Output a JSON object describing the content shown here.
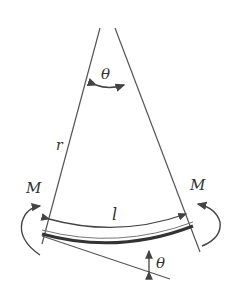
{
  "diagram": {
    "labels": {
      "apex_angle": "θ",
      "radius": "r",
      "moment_left": "M",
      "moment_right": "M",
      "arc_length": "l",
      "tangent_angle": "θ"
    },
    "colors": {
      "line": "#555555",
      "beam": "#333333",
      "text": "#333333"
    }
  }
}
